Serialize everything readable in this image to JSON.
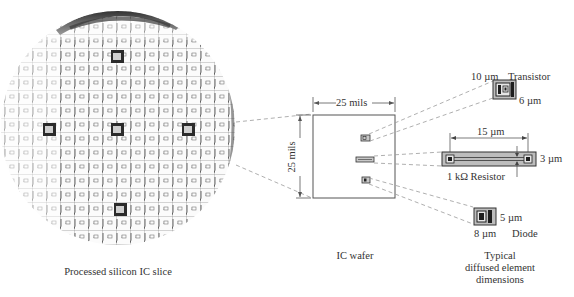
{
  "figure": {
    "slice": {
      "caption": "Processed silicon IC slice",
      "chip_marker": "IC",
      "highlighted_cells": [
        [
          118,
          57
        ],
        [
          50,
          130
        ],
        [
          118,
          130
        ],
        [
          188,
          130
        ],
        [
          122,
          210
        ]
      ]
    },
    "ic_wafer": {
      "caption": "IC wafer",
      "width_label": "25 mils",
      "height_label": "25 mils"
    },
    "elements": {
      "caption_lines": [
        "Typical",
        "diffused element",
        "dimensions"
      ],
      "transistor": {
        "name": "Transistor",
        "width": "10 µm",
        "height": "6 µm"
      },
      "resistor": {
        "name": "1 kΩ Resistor",
        "length": "15 µm",
        "width": "3 µm"
      },
      "diode": {
        "name": "Diode",
        "width": "8 µm",
        "height": "5 µm"
      }
    },
    "colors": {
      "line": "#444444",
      "dash": "#9a9a9a",
      "element_fill": "#b8b8b8",
      "dark": "#1e1e1e"
    }
  }
}
